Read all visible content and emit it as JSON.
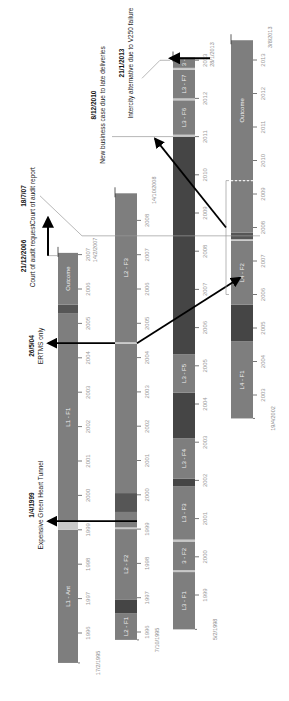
{
  "diagram": {
    "orientation": "rotated-90-ccw",
    "colors": {
      "segment_default": "#7e7e7e",
      "segment_dark": "#565656",
      "segment_darker": "#454545",
      "separator": "#c8c8c8",
      "tick": "#555555",
      "event_line": "#9a9a9a",
      "arrow": "#000000"
    },
    "lanes": [
      {
        "id": "L1",
        "start_label": "17/2/1995",
        "end_label": "",
        "ticks": [
          "1996",
          "1997",
          "1998",
          "1999",
          "2000",
          "2001",
          "2002",
          "2003",
          "2004",
          "2005",
          "2006",
          "2007"
        ],
        "tick_years": [
          1996,
          1997,
          1998,
          1999,
          2000,
          2001,
          2002,
          2003,
          2004,
          2005,
          2006,
          2007
        ],
        "start": 1995.13,
        "end": 2007.05,
        "segments": [
          {
            "label": "L1 - Ant",
            "from": 1995.13,
            "to": 1999.0,
            "shade": "default"
          },
          {
            "label": "",
            "from": 1999.0,
            "to": 1999.25,
            "shade": "separator"
          },
          {
            "label": "L1 - F1",
            "from": 1999.25,
            "to": 2005.3,
            "shade": "default"
          },
          {
            "label": "",
            "from": 2005.3,
            "to": 2005.55,
            "shade": "dark"
          },
          {
            "label": "Outcome",
            "from": 2005.55,
            "to": 2007.05,
            "shade": "default"
          }
        ],
        "end_date_label": "14/2/2007"
      },
      {
        "id": "L2",
        "start_label": "7/10/1995",
        "ticks": [
          "1996",
          "1997",
          "1998",
          "1999",
          "2000",
          "2001",
          "2002",
          "2003",
          "2004",
          "2005",
          "2006",
          "2007",
          "2008"
        ],
        "tick_years": [
          1996,
          1997,
          1998,
          1999,
          2000,
          2001,
          2002,
          2003,
          2004,
          2005,
          2006,
          2007,
          2008
        ],
        "start": 1995.77,
        "end": 2008.79,
        "segments": [
          {
            "label": "L2 - F1",
            "from": 1995.77,
            "to": 1996.55,
            "shade": "default"
          },
          {
            "label": "",
            "from": 1996.55,
            "to": 1996.95,
            "shade": "darker"
          },
          {
            "label": "L2 - F2",
            "from": 1996.95,
            "to": 1999.0,
            "shade": "default"
          },
          {
            "label": "",
            "from": 1999.0,
            "to": 1999.05,
            "shade": "separator"
          },
          {
            "label": "",
            "from": 1999.05,
            "to": 1999.5,
            "shade": "default"
          },
          {
            "label": "",
            "from": 1999.5,
            "to": 2000.05,
            "shade": "dark"
          },
          {
            "label": "",
            "from": 2000.05,
            "to": 2004.4,
            "shade": "default"
          },
          {
            "label": "",
            "from": 2004.4,
            "to": 2004.45,
            "shade": "separator"
          },
          {
            "label": "L2 - F3",
            "from": 2004.45,
            "to": 2008.79,
            "shade": "default"
          }
        ],
        "end_date_label": "14/10/2008"
      },
      {
        "id": "L3",
        "start_label": "5/2/1998",
        "ticks": [
          "1999",
          "2000",
          "2001",
          "2002",
          "2003",
          "2004",
          "2005",
          "2006",
          "2007",
          "2008",
          "2009",
          "2010",
          "2011",
          "2012",
          "2013"
        ],
        "tick_years": [
          1999,
          2000,
          2001,
          2002,
          2003,
          2004,
          2005,
          2006,
          2007,
          2008,
          2009,
          2010,
          2011,
          2012,
          2013
        ],
        "start": 1998.1,
        "end": 2013.07,
        "segments": [
          {
            "label": "L3 - F1",
            "from": 1998.1,
            "to": 1999.6,
            "shade": "default"
          },
          {
            "label": "",
            "from": 1999.6,
            "to": 1999.65,
            "shade": "separator"
          },
          {
            "label": "3 - F2",
            "from": 1999.65,
            "to": 2000.4,
            "shade": "default"
          },
          {
            "label": "",
            "from": 2000.4,
            "to": 2000.45,
            "shade": "separator"
          },
          {
            "label": "L3 - F3",
            "from": 2000.45,
            "to": 2001.85,
            "shade": "default"
          },
          {
            "label": "",
            "from": 2001.85,
            "to": 2002.05,
            "shade": "darker"
          },
          {
            "label": "L3 - F4",
            "from": 2002.05,
            "to": 2003.1,
            "shade": "default"
          },
          {
            "label": "",
            "from": 2003.1,
            "to": 2004.3,
            "shade": "darker"
          },
          {
            "label": "L3 - F5",
            "from": 2004.3,
            "to": 2005.3,
            "shade": "default"
          },
          {
            "label": "",
            "from": 2005.3,
            "to": 2011.0,
            "shade": "darker"
          },
          {
            "label": "",
            "from": 2011.0,
            "to": 2011.05,
            "shade": "separator"
          },
          {
            "label": "L3 - F6",
            "from": 2011.05,
            "to": 2011.95,
            "shade": "default"
          },
          {
            "label": "",
            "from": 2011.95,
            "to": 2012.0,
            "shade": "separator"
          },
          {
            "label": "L3 - F7",
            "from": 2012.0,
            "to": 2012.75,
            "shade": "default"
          },
          {
            "label": "",
            "from": 2012.75,
            "to": 2012.8,
            "shade": "separator"
          },
          {
            "label": "3 -",
            "from": 2012.8,
            "to": 2013.07,
            "shade": "default"
          }
        ],
        "end_date_label": "28/1/2013"
      },
      {
        "id": "L4",
        "start_label": "19/4/2002",
        "ticks": [
          "2003",
          "2004",
          "2005",
          "2006",
          "2007",
          "2008",
          "2009",
          "2010",
          "2011",
          "2012",
          "2013"
        ],
        "tick_years": [
          2003,
          2004,
          2005,
          2006,
          2007,
          2008,
          2009,
          2010,
          2011,
          2012,
          2013
        ],
        "start": 2002.3,
        "end": 2013.59,
        "segments": [
          {
            "label": "L4 - F1",
            "from": 2002.3,
            "to": 2004.6,
            "shade": "default"
          },
          {
            "label": "",
            "from": 2004.6,
            "to": 2005.7,
            "shade": "darker"
          },
          {
            "label": "L4 - F2",
            "from": 2005.7,
            "to": 2007.6,
            "shade": "default"
          },
          {
            "label": "",
            "from": 2007.6,
            "to": 2007.65,
            "shade": "separator"
          },
          {
            "label": "",
            "from": 2007.65,
            "to": 2007.85,
            "shade": "dark"
          },
          {
            "label": "",
            "from": 2007.85,
            "to": 2009.4,
            "shade": "default"
          },
          {
            "label": "Outcome",
            "from": 2009.4,
            "to": 2013.59,
            "shade": "default"
          }
        ],
        "dashed_divider_at": 2009.4,
        "end_date_label": "3/8/2013"
      }
    ],
    "events": [
      {
        "date": "1/4/1999",
        "description": "Expensive Green Heart Tunnel"
      },
      {
        "date": "26/5/04",
        "description": "ERTMS only"
      },
      {
        "date": "21/12/2006",
        "description": "Court of audit request"
      },
      {
        "date": "18/7/07",
        "description": "Court of audit report"
      },
      {
        "date": "8/12/2010",
        "description": "New business case due to late deliveries"
      },
      {
        "date": "21/1/2013",
        "description": "Intercity alternative due to V250 failure"
      }
    ]
  }
}
